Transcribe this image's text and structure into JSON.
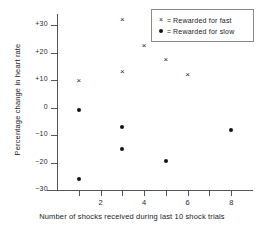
{
  "chart_data": {
    "type": "scatter",
    "title": "",
    "xlabel": "Number of shocks received during last 10 shock trials",
    "ylabel": "Percentage change in heart rate",
    "xlim": [
      0,
      9
    ],
    "ylim": [
      -30,
      35
    ],
    "grid": false,
    "legend_position": "top-right",
    "xticks": [
      1,
      2,
      3,
      4,
      5,
      6,
      7,
      8
    ],
    "xticklabels": [
      "",
      "2",
      "",
      "4",
      "",
      "6",
      "",
      "8"
    ],
    "yticks": [
      30,
      20,
      10,
      0,
      -10,
      -20,
      -30
    ],
    "yticklabels": [
      "+30",
      "+20",
      "+10",
      "0",
      "−10",
      "−20",
      "−30"
    ],
    "series": [
      {
        "name": "Rewarded for fast",
        "marker": "x",
        "legend_symbol": "×",
        "points": [
          {
            "x": 1,
            "y": 10
          },
          {
            "x": 3,
            "y": 32
          },
          {
            "x": 3,
            "y": 13
          },
          {
            "x": 4,
            "y": 22.5
          },
          {
            "x": 5,
            "y": 17.5
          },
          {
            "x": 6,
            "y": 12
          }
        ]
      },
      {
        "name": "Rewarded for slow",
        "marker": "dot",
        "legend_symbol": "●",
        "points": [
          {
            "x": 1,
            "y": -1
          },
          {
            "x": 1,
            "y": -26
          },
          {
            "x": 3,
            "y": -7
          },
          {
            "x": 3,
            "y": -15
          },
          {
            "x": 5,
            "y": -19.5
          },
          {
            "x": 8,
            "y": -8
          }
        ]
      }
    ],
    "legend": [
      {
        "symbol": "×",
        "separator": "=",
        "label": "Rewarded for fast"
      },
      {
        "symbol": "●",
        "separator": "=",
        "label": "Rewarded for slow"
      }
    ]
  }
}
